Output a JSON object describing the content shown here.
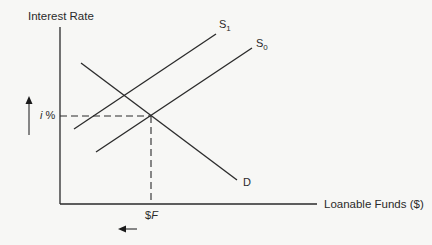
{
  "diagram": {
    "y_axis_label": "Interest Rate",
    "x_axis_label": "Loanable Funds ($)",
    "equilibrium_rate_label_var": "i",
    "equilibrium_rate_label_unit": " %",
    "equilibrium_quantity_label_prefix": "$",
    "equilibrium_quantity_label_var": "F",
    "curves": [
      {
        "name": "S",
        "subscript": "1",
        "type": "supply",
        "shift": "leftward"
      },
      {
        "name": "S",
        "subscript": "0",
        "type": "supply",
        "shift": "original"
      },
      {
        "name": "D",
        "subscript": "",
        "type": "demand"
      }
    ],
    "arrows": [
      {
        "direction": "up",
        "meaning": "interest rate rises"
      },
      {
        "direction": "left",
        "meaning": "quantity of loanable funds falls"
      }
    ],
    "colors": {
      "line": "#2a2a2a",
      "background": "#f7f7f5"
    }
  }
}
